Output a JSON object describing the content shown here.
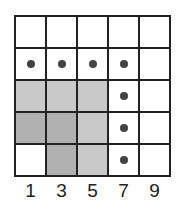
{
  "diagram": {
    "columns": 5,
    "rows": 5,
    "column_labels": [
      "1",
      "3",
      "5",
      "7",
      "9"
    ],
    "shaded_cells": [
      {
        "row": 2,
        "col": 0,
        "shade": "light"
      },
      {
        "row": 2,
        "col": 1,
        "shade": "light"
      },
      {
        "row": 2,
        "col": 2,
        "shade": "light"
      },
      {
        "row": 3,
        "col": 0,
        "shade": "dark"
      },
      {
        "row": 3,
        "col": 1,
        "shade": "dark"
      },
      {
        "row": 3,
        "col": 2,
        "shade": "light"
      },
      {
        "row": 4,
        "col": 1,
        "shade": "dark"
      },
      {
        "row": 4,
        "col": 2,
        "shade": "light"
      }
    ],
    "dots": [
      {
        "row": 1,
        "col": 0
      },
      {
        "row": 1,
        "col": 1
      },
      {
        "row": 1,
        "col": 2
      },
      {
        "row": 1,
        "col": 3
      },
      {
        "row": 2,
        "col": 3
      },
      {
        "row": 3,
        "col": 3
      },
      {
        "row": 4,
        "col": 3
      }
    ],
    "colors": {
      "grid": "#222222",
      "dot": "#444444",
      "light": "#c9c9c9",
      "dark": "#b0b0b0"
    }
  }
}
